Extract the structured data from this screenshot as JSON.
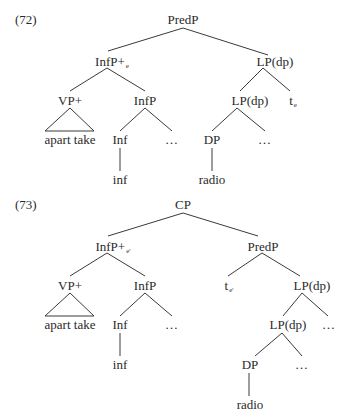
{
  "examples": [
    {
      "number": "(72)",
      "nodes": {
        "root": "PredP",
        "infp_plus": "InfP+",
        "infp_plus_sub": "e",
        "lp_top": "LP(dp)",
        "vp_plus": "VP+",
        "infp": "InfP",
        "lp_inner": "LP(dp)",
        "trace": "t",
        "trace_sub": "e",
        "apart_take": "apart take",
        "inf_head": "Inf",
        "infp_dots": "…",
        "dp": "DP",
        "lp_dots": "…",
        "inf_word": "inf",
        "radio": "radio"
      }
    },
    {
      "number": "(73)",
      "nodes": {
        "root": "CP",
        "infp_plus": "InfP+",
        "infp_plus_sub": "e'",
        "predp": "PredP",
        "vp_plus": "VP+",
        "infp": "InfP",
        "trace": "t",
        "trace_sub": "e'",
        "lp_top": "LP(dp)",
        "apart_take": "apart take",
        "inf_head": "Inf",
        "infp_dots": "…",
        "lp_inner": "LP(dp)",
        "lp_top_dots": "…",
        "inf_word": "inf",
        "dp": "DP",
        "lp_inner_dots": "…",
        "radio": "radio"
      }
    }
  ]
}
